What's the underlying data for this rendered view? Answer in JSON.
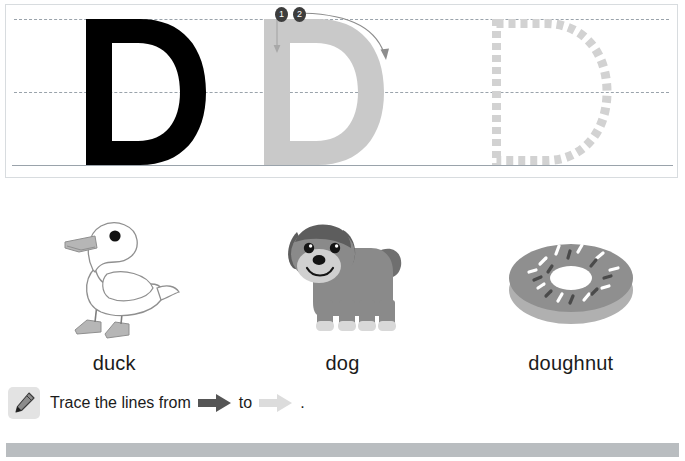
{
  "worksheet": {
    "letter": "D",
    "trace_box": {
      "guides": [
        "top-dashed-line",
        "middle-dashed-line",
        "solid-baseline"
      ],
      "letters": [
        {
          "style": "solid",
          "label": "D",
          "color": "#000000"
        },
        {
          "style": "grey-guide",
          "label": "D",
          "color": "#c9c9c9"
        },
        {
          "style": "dotted-outline",
          "label": "D",
          "color": "#d2d2d2"
        }
      ],
      "stroke_markers": [
        {
          "number": "1",
          "icon": "stroke-order-badge-1",
          "direction": "down"
        },
        {
          "number": "2",
          "icon": "stroke-order-badge-2",
          "direction": "curve-right-down"
        }
      ],
      "marker_color": "#3d3d3d",
      "guide_color": "#9aa3ab"
    },
    "pictures": [
      {
        "caption": "duck",
        "art": "duck-illustration"
      },
      {
        "caption": "dog",
        "art": "dog-illustration"
      },
      {
        "caption": "doughnut",
        "art": "doughnut-illustration"
      }
    ],
    "instruction": {
      "icon": "crayon-icon",
      "text_before": "Trace the lines from",
      "text_middle": "to",
      "text_after": ".",
      "arrow_from_color": "#555555",
      "arrow_to_color": "#dcdcdc"
    },
    "footer": {
      "color": "#b9bdc0"
    }
  }
}
